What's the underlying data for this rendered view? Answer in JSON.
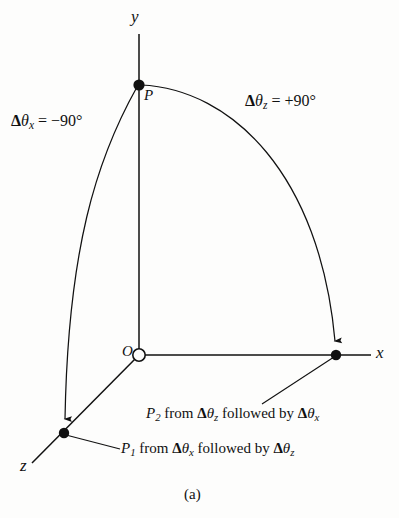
{
  "figure": {
    "domain": "diagram",
    "figure_label": "(a)",
    "background_color": "#fdfdfc",
    "stroke_color": "#111111"
  },
  "axes": {
    "y": {
      "label": "y",
      "direction": "up",
      "from_origin_px": [
        139,
        355
      ],
      "to_px": [
        139,
        34
      ]
    },
    "x": {
      "label": "x",
      "direction": "right",
      "from_origin_px": [
        139,
        355
      ],
      "to_px": [
        371,
        355
      ]
    },
    "z": {
      "label": "z",
      "direction": "down-left",
      "from_origin_px": [
        139,
        355
      ],
      "to_px": [
        32,
        463
      ]
    },
    "origin": {
      "label": "O",
      "marker": "open-circle",
      "position_px": [
        139,
        355
      ]
    }
  },
  "points": [
    {
      "id": "P",
      "label": "P",
      "marker": "filled-dot",
      "position_px": [
        139,
        85
      ],
      "description": "start point on y axis"
    },
    {
      "id": "P1",
      "label": "P1",
      "marker": "filled-dot",
      "position_px": [
        64,
        433
      ],
      "description": "end point on z axis"
    },
    {
      "id": "P2",
      "label": "P2",
      "marker": "filled-dot",
      "position_px": [
        336,
        355
      ],
      "description": "end point on x axis"
    }
  ],
  "arcs": [
    {
      "id": "arc-theta-x",
      "from": "P",
      "to": "P1",
      "arrowhead": "at-end",
      "annotation": {
        "delta": "Δ",
        "theta": "θ",
        "subscript": "x",
        "equals": "=",
        "value": "−90°"
      },
      "annotation_text": "Δθx = −90°"
    },
    {
      "id": "arc-theta-z",
      "from": "P",
      "to": "P2",
      "arrowhead": "at-end",
      "annotation": {
        "delta": "Δ",
        "theta": "θ",
        "subscript": "z",
        "equals": "=",
        "value": "+90°"
      },
      "annotation_text": "Δθz = +90°"
    }
  ],
  "annotations": {
    "theta_x": {
      "delta": "Δ",
      "theta": "θ",
      "subscript": "x",
      "equals": " = ",
      "value": "−90°"
    },
    "theta_z": {
      "delta": "Δ",
      "theta": "θ",
      "subscript": "z",
      "equals": " = ",
      "value": "+90°"
    }
  },
  "captions": [
    {
      "id": "caption-p2",
      "point": "P",
      "point_sub": "2",
      "word_from": " from ",
      "first_delta": "Δ",
      "first_theta": "θ",
      "first_sub": "z",
      "word_followed": " followed by ",
      "second_delta": "Δ",
      "second_theta": "θ",
      "second_sub": "x",
      "plain_text": "P2 from Δθz followed by Δθx",
      "leader_line": {
        "from_px": [
          336,
          355
        ],
        "to_px": [
          262,
          404
        ]
      }
    },
    {
      "id": "caption-p1",
      "point": "P",
      "point_sub": "1",
      "word_from": " from ",
      "first_delta": "Δ",
      "first_theta": "θ",
      "first_sub": "x",
      "word_followed": " followed by ",
      "second_delta": "Δ",
      "second_theta": "θ",
      "second_sub": "z",
      "plain_text": "P1 from Δθx followed by Δθz",
      "leader_line": {
        "from_px": [
          64,
          433
        ],
        "to_px": [
          120,
          449
        ]
      }
    }
  ],
  "figure_caption": "(a)"
}
